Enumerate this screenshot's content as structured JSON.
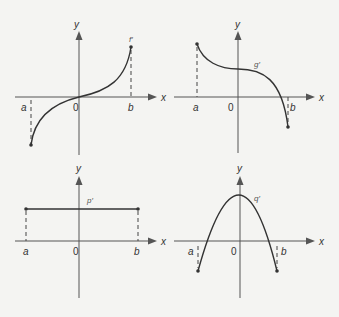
{
  "panels": [
    {
      "id": "top-left",
      "function_label": "f′",
      "x_axis_label": "x",
      "y_axis_label": "y",
      "origin_label": "0",
      "a_label": "a",
      "b_label": "b",
      "shape": "increasing cubic-like, negative at a, positive at b"
    },
    {
      "id": "top-right",
      "function_label": "g′",
      "x_axis_label": "x",
      "y_axis_label": "y",
      "origin_label": "0",
      "a_label": "a",
      "b_label": "b",
      "shape": "decreasing cubic-like, positive at a, negative at b"
    },
    {
      "id": "bottom-left",
      "function_label": "p′",
      "x_axis_label": "x",
      "y_axis_label": "y",
      "origin_label": "0",
      "a_label": "a",
      "b_label": "b",
      "shape": "constant positive"
    },
    {
      "id": "bottom-right",
      "function_label": "q′",
      "x_axis_label": "x",
      "y_axis_label": "y",
      "origin_label": "0",
      "a_label": "a",
      "b_label": "b",
      "shape": "downward parabola, negative at a and b"
    }
  ]
}
